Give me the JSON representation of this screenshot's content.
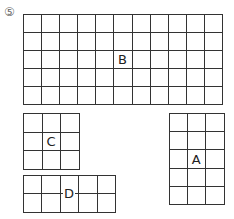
{
  "problem_number": "⑤",
  "shapes": [
    {
      "label": "B",
      "cols": 11,
      "rows": 5,
      "x": 23,
      "y": 14,
      "cell": 18.1
    },
    {
      "label": "C",
      "cols": 3,
      "rows": 3,
      "x": 23,
      "y": 113,
      "cell": 18.7
    },
    {
      "label": "A",
      "cols": 3,
      "rows": 5,
      "x": 169,
      "y": 113,
      "cell": 18.2
    },
    {
      "label": "D",
      "cols": 5,
      "rows": 2,
      "x": 23,
      "y": 175,
      "cell": 18.4
    }
  ]
}
